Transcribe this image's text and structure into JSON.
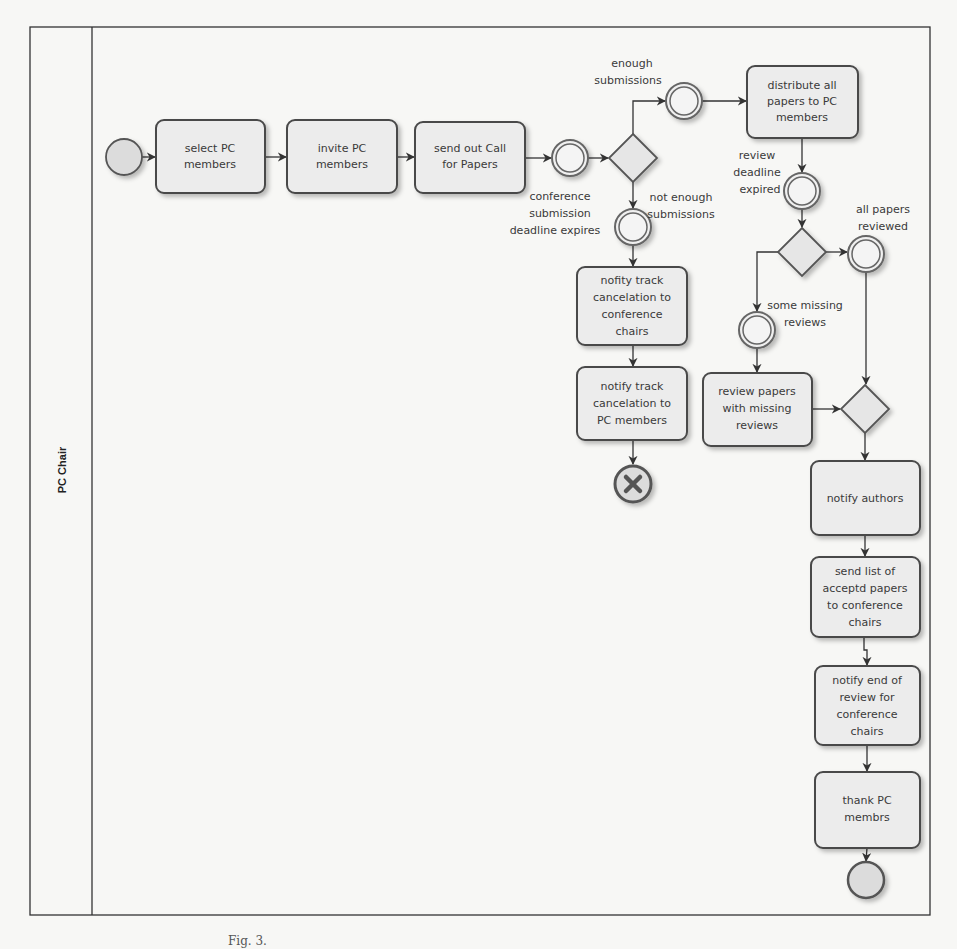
{
  "diagram": {
    "type": "BPMN process",
    "colors": {
      "background": "#f7f7f5",
      "task_fill": "#ececec",
      "task_stroke": "#4a4a4a",
      "event_fill": "#dcdcdc",
      "line": "#333333"
    },
    "pool": {
      "lane_label": "PC Chair"
    },
    "start_event": {
      "label": ""
    },
    "tasks": {
      "select_pc_members": [
        "select PC",
        "members"
      ],
      "invite_pc_members": [
        "invite PC",
        "members"
      ],
      "send_call_for_papers": [
        "send out Call",
        "for Papers"
      ],
      "distribute_papers": [
        "distribute all",
        "papers to PC",
        "members"
      ],
      "notify_cancel_chairs": [
        "nofity track",
        "cancelation to",
        "conference",
        "chairs"
      ],
      "notify_cancel_pc": [
        "notify track",
        "cancelation to",
        "PC members"
      ],
      "review_missing": [
        "review papers",
        "with missing",
        "reviews"
      ],
      "notify_authors": [
        "notify authors"
      ],
      "send_accepted_list": [
        "send list of",
        "acceptd papers",
        "to conference",
        "chairs"
      ],
      "notify_end_review": [
        "notify end of",
        "review for",
        "conference",
        "chairs"
      ],
      "thank_pc": [
        "thank PC",
        "membrs"
      ]
    },
    "event_labels": {
      "submission_deadline": [
        "conference",
        "submission",
        "deadline expires"
      ],
      "enough_submissions": [
        "enough",
        "submissions"
      ],
      "not_enough_submissions": [
        "not enough",
        "submissions"
      ],
      "review_deadline": [
        "review",
        "deadline",
        "expired"
      ],
      "all_reviewed": [
        "all papers",
        "reviewed"
      ],
      "some_missing": [
        "some missing",
        "reviews"
      ]
    },
    "caption": "Fig. 3."
  }
}
